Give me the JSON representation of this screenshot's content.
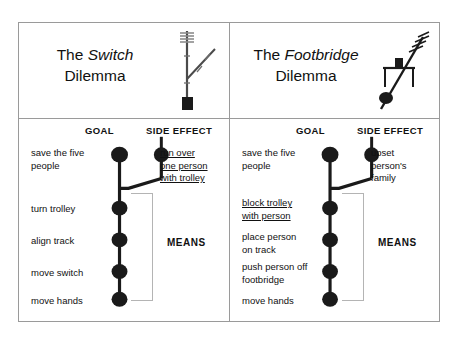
{
  "figure": {
    "panels": [
      {
        "id": "switch",
        "title_prefix": "The ",
        "title_emphasis": "Switch",
        "title_suffix": "Dilemma",
        "scene_icon": "railway-switch-icon",
        "headings": {
          "goal": "GOAL",
          "side_effect": "SIDE EFFECT",
          "means": "MEANS"
        },
        "goal_label": {
          "lines": [
            "save the five",
            "people"
          ],
          "underlined": false
        },
        "side_effect_label": {
          "lines": [
            "run over",
            "one person",
            "with trolley"
          ],
          "underlined": true
        },
        "means_labels": [
          {
            "lines": [
              "turn trolley"
            ],
            "underlined": false
          },
          {
            "lines": [
              "align track"
            ],
            "underlined": false
          },
          {
            "lines": [
              "move switch"
            ],
            "underlined": false
          },
          {
            "lines": [
              "move hands"
            ],
            "underlined": false
          }
        ]
      },
      {
        "id": "footbridge",
        "title_prefix": "The ",
        "title_emphasis": "Footbridge",
        "title_suffix": "Dilemma",
        "scene_icon": "footbridge-trolley-icon",
        "headings": {
          "goal": "GOAL",
          "side_effect": "SIDE EFFECT",
          "means": "MEANS"
        },
        "goal_label": {
          "lines": [
            "save the five",
            "people"
          ],
          "underlined": false
        },
        "side_effect_label": {
          "lines": [
            "upset",
            "person's",
            "family"
          ],
          "underlined": false
        },
        "means_labels": [
          {
            "lines": [
              "block trolley",
              "with person"
            ],
            "underlined": true
          },
          {
            "lines": [
              "place person",
              "on track"
            ],
            "underlined": false
          },
          {
            "lines": [
              "push person off",
              "footbridge"
            ],
            "underlined": false
          },
          {
            "lines": [
              "move hands"
            ],
            "underlined": false
          }
        ]
      }
    ],
    "colors": {
      "ink": "#111111",
      "frame": "#9a9a9a",
      "bracket": "#b4b4b4",
      "background": "#ffffff"
    }
  }
}
